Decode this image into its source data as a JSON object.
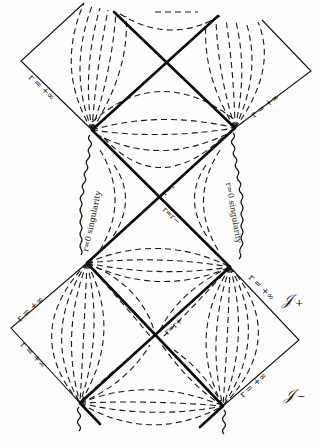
{
  "diagram": {
    "type": "penrose-carter-diagram",
    "labels": {
      "r_inf": "r = +∞",
      "r_zero_singularity": "r=0 singularity",
      "r_minus": "r=r−",
      "r_plus": "r=r+",
      "scri_plus": "𝒥",
      "scri_plus_sub": "+",
      "scri_minus": "𝒥",
      "scri_minus_sub": "−"
    },
    "colors": {
      "ink": "#111111",
      "background": "#fdfdfd"
    }
  }
}
